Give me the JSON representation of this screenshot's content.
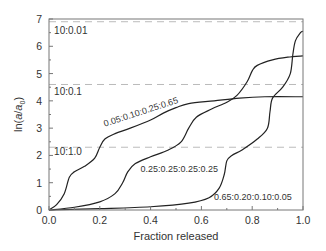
{
  "chart_data": {
    "type": "line",
    "title": "",
    "xlabel": "Fraction released",
    "ylabel": "ln(a/a0)",
    "xlim": [
      0.0,
      1.0
    ],
    "ylim": [
      0,
      7
    ],
    "grid": false,
    "legend": "none (curves labeled inline)",
    "x_ticks": [
      "0.0",
      "0.2",
      "0.4",
      "0.6",
      "0.8",
      "1.0"
    ],
    "y_ticks": [
      "0",
      "1",
      "2",
      "3",
      "4",
      "5",
      "6",
      "7"
    ],
    "reference_lines": [
      {
        "label": "10:0.01",
        "y": 6.9,
        "style": "dashed"
      },
      {
        "label": "10:0.1",
        "y": 4.6,
        "style": "dashed"
      },
      {
        "label": "10:1.0",
        "y": 2.3,
        "style": "dashed"
      }
    ],
    "series": [
      {
        "name": "0.05:0.10:0.25:0.65",
        "x": [
          0.0,
          0.03,
          0.06,
          0.08,
          0.1,
          0.14,
          0.18,
          0.2,
          0.22,
          0.26,
          0.32,
          0.4,
          0.45,
          0.5,
          0.55,
          0.65,
          0.75,
          0.85,
          1.0
        ],
        "y": [
          0.0,
          0.2,
          0.6,
          1.2,
          1.4,
          1.6,
          1.9,
          2.3,
          2.6,
          2.8,
          3.0,
          3.3,
          3.55,
          3.75,
          3.9,
          4.0,
          4.1,
          4.15,
          4.15
        ]
      },
      {
        "name": "0.25:0.25:0.25:0.25",
        "x": [
          0.0,
          0.1,
          0.2,
          0.26,
          0.29,
          0.31,
          0.34,
          0.4,
          0.47,
          0.52,
          0.55,
          0.58,
          0.64,
          0.7,
          0.74,
          0.78,
          0.8,
          0.82,
          0.88,
          0.94,
          1.0
        ],
        "y": [
          0.0,
          0.1,
          0.3,
          0.6,
          1.0,
          1.4,
          1.7,
          1.95,
          2.2,
          2.5,
          3.0,
          3.4,
          3.7,
          3.95,
          4.2,
          4.7,
          5.1,
          5.3,
          5.5,
          5.6,
          5.65
        ]
      },
      {
        "name": "0.65:0.20:0.10:0.05",
        "x": [
          0.0,
          0.2,
          0.4,
          0.55,
          0.63,
          0.67,
          0.69,
          0.7,
          0.72,
          0.76,
          0.82,
          0.86,
          0.87,
          0.88,
          0.92,
          0.95,
          0.96,
          0.97,
          0.99,
          1.0
        ],
        "y": [
          0.0,
          0.05,
          0.12,
          0.25,
          0.45,
          0.8,
          1.3,
          1.8,
          2.0,
          2.2,
          2.6,
          3.0,
          3.6,
          4.1,
          4.5,
          5.0,
          5.7,
          6.2,
          6.5,
          6.55
        ]
      }
    ],
    "annotations": [
      {
        "text": "10:0.01",
        "x": 0.02,
        "y": 6.45
      },
      {
        "text": "10:0.1",
        "x": 0.02,
        "y": 4.2
      },
      {
        "text": "10:1.0",
        "x": 0.02,
        "y": 2.0
      },
      {
        "text": "0.05:0.10:0.25:0.65",
        "x": 0.22,
        "y": 3.05,
        "rotation": -18
      },
      {
        "text": "0.25:0.25:0.25:0.25",
        "x": 0.36,
        "y": 1.4
      },
      {
        "text": "0.65:0.20:0.10:0.05",
        "x": 0.65,
        "y": 0.35
      }
    ],
    "colors": {
      "curve": "#222222",
      "axis": "#777777",
      "dashed": "#bbbbbb",
      "text": "#333333"
    }
  }
}
